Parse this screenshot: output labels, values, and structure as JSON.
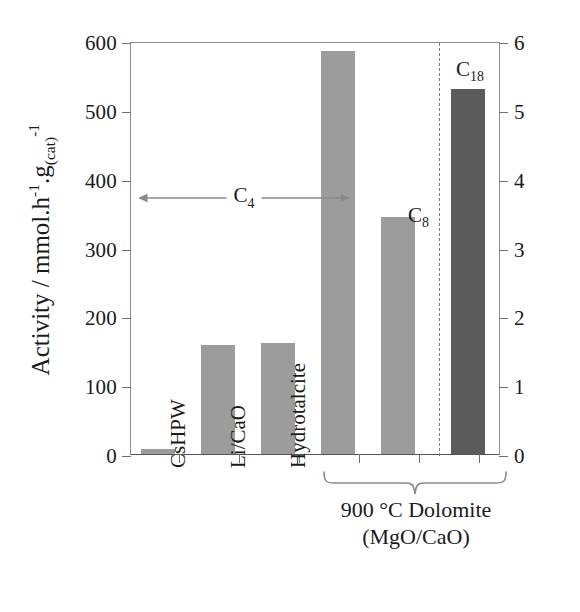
{
  "chart_data": {
    "type": "bar",
    "title": "",
    "xlabel": "",
    "ylabel": "Activity / mmol.h-1.g(cat)-1",
    "ylabel_parts": {
      "lead": "Activity / mmol.h",
      "sup1": "-1",
      "mid": ".g",
      "sub1": "(cat)",
      "sup2": "-1"
    },
    "ylim": [
      0,
      600
    ],
    "yticks": [
      0,
      100,
      200,
      300,
      400,
      500,
      600
    ],
    "y2label": "",
    "y2lim": [
      0,
      6
    ],
    "y2ticks": [
      0,
      1,
      2,
      3,
      4,
      5,
      6
    ],
    "grid": false,
    "legend": "none",
    "categories": [
      "CsHPW",
      "Li/CaO",
      "Hydrotalcite",
      "",
      "",
      ""
    ],
    "values": [
      8,
      158,
      161,
      585,
      345,
      530
    ],
    "bar_colors": [
      "#9c9c9c",
      "#9c9c9c",
      "#9c9c9c",
      "#9c9c9c",
      "#9c9c9c",
      "#5b5b5b"
    ],
    "annotations": [
      {
        "name": "c4-span",
        "text": "C4",
        "text_parts": {
          "main": "C",
          "sub": "4"
        }
      },
      {
        "name": "c8-label",
        "text": "C8",
        "text_parts": {
          "main": "C",
          "sub": "8"
        }
      },
      {
        "name": "c18-label",
        "text": "C18",
        "text_parts": {
          "main": "C",
          "sub": "18"
        }
      }
    ],
    "group_label": {
      "line1": "900 °C Dolomite",
      "line2": "(MgO/CaO)"
    }
  },
  "axes": {
    "left_ticks": [
      "600",
      "500",
      "400",
      "300",
      "200",
      "100",
      "0"
    ],
    "right_ticks": [
      "6",
      "5",
      "4",
      "3",
      "2",
      "1",
      "0"
    ]
  },
  "labels": {
    "cat0": "CsHPW",
    "cat1": "Li/CaO",
    "cat2": "Hydrotalcite"
  },
  "annotation_text": {
    "c4_main": "C",
    "c4_sub": "4",
    "c8_main": "C",
    "c8_sub": "8",
    "c18_main": "C",
    "c18_sub": "18"
  },
  "group": {
    "line1": "900 °C Dolomite",
    "line2": "(MgO/CaO)"
  },
  "ytitle": {
    "lead": "Activity / mmol.h",
    "sup1": "-1",
    "mid": ".g",
    "sub1": "(cat)",
    "sup2": "-1"
  },
  "colors": {
    "bar_light": "#9c9c9c",
    "bar_dark": "#5b5b5b",
    "axis": "#6f6f6f",
    "text": "#1a1a1a"
  }
}
